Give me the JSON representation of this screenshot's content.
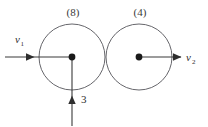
{
  "figure": {
    "background_color": "#ffffff",
    "line_color": "#3a3a3a",
    "circle_stroke_color": "#55555a",
    "dot_color": "#1a1a1a"
  },
  "bodies": [
    {
      "id": "left",
      "mass_label": "(8)",
      "center_x": 72,
      "center_y": 57,
      "radius": 33
    },
    {
      "id": "right",
      "mass_label": "(4)",
      "center_x": 139,
      "center_y": 57,
      "radius": 33
    }
  ],
  "vectors": [
    {
      "id": "v1",
      "symbol": "v",
      "subscript": "1",
      "direction": "right",
      "label_x": 15,
      "label_y": 43
    },
    {
      "id": "v2",
      "symbol": "v",
      "subscript": "2",
      "direction": "right",
      "label_x": 186,
      "label_y": 61
    },
    {
      "id": "v3",
      "symbol": "3",
      "subscript": "",
      "direction": "up",
      "label_x": 82,
      "label_y": 102
    }
  ],
  "labels": {
    "left_mass": "(8)",
    "right_mass": "(4)",
    "v1_symbol": "v",
    "v1_subscript": "1",
    "v2_symbol": "v",
    "v2_subscript": "2",
    "vertical_value": "3"
  }
}
